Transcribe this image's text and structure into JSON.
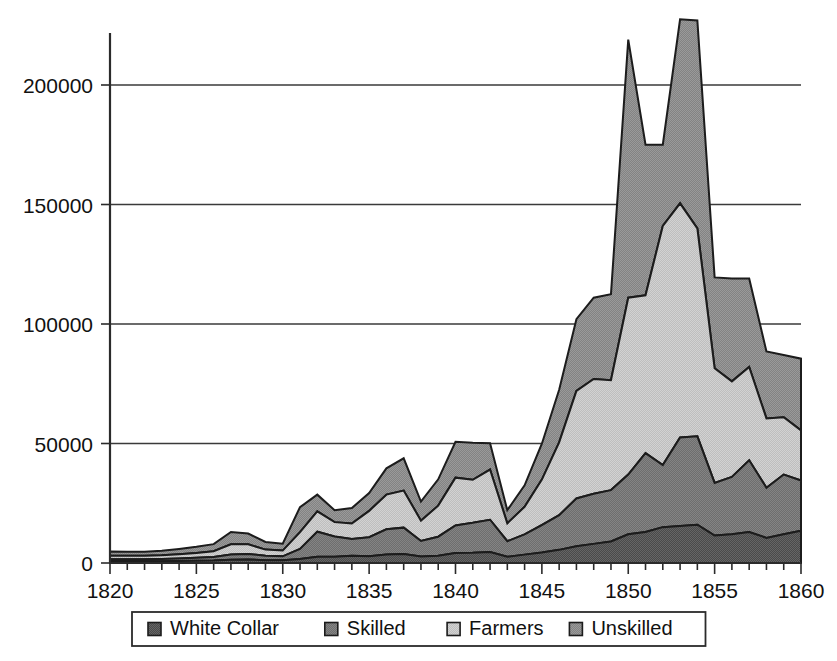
{
  "chart_data": {
    "type": "area",
    "stacked": true,
    "title": "",
    "subtitle": "",
    "xlabel": "",
    "ylabel": "",
    "xlim": [
      1820,
      1860
    ],
    "ylim": [
      0,
      225000
    ],
    "grid": true,
    "legend_position": "bottom",
    "y_ticks": [
      0,
      50000,
      100000,
      150000,
      200000
    ],
    "y_tick_labels": [
      "0",
      "50000",
      "100000",
      "150000",
      "200000"
    ],
    "x_ticks": [
      1820,
      1825,
      1830,
      1835,
      1840,
      1845,
      1850,
      1855,
      1860
    ],
    "x_tick_labels": [
      "1820",
      "1825",
      "1830",
      "1835",
      "1840",
      "1845",
      "1850",
      "1855",
      "1860"
    ],
    "x_minor_tick_interval": 1,
    "x": [
      1820,
      1821,
      1822,
      1823,
      1824,
      1825,
      1826,
      1827,
      1828,
      1829,
      1830,
      1831,
      1832,
      1833,
      1834,
      1835,
      1836,
      1837,
      1838,
      1839,
      1840,
      1841,
      1842,
      1843,
      1844,
      1845,
      1846,
      1847,
      1848,
      1849,
      1850,
      1851,
      1852,
      1853,
      1854,
      1855,
      1856,
      1857,
      1858,
      1859,
      1860
    ],
    "series": [
      {
        "name": "White Collar",
        "color": "#555555",
        "order": 1,
        "values": [
          700,
          700,
          700,
          700,
          800,
          900,
          1000,
          1400,
          1500,
          1200,
          1100,
          1700,
          2600,
          2600,
          3000,
          2800,
          3600,
          3800,
          2700,
          3000,
          4200,
          4300,
          4600,
          2600,
          3500,
          4400,
          5500,
          7000,
          8000,
          9000,
          12000,
          13000,
          15000,
          15500,
          16000,
          11500,
          12000,
          13000,
          10500,
          12000,
          13500
        ]
      },
      {
        "name": "Skilled",
        "color": "#777777",
        "order": 2,
        "values": [
          900,
          900,
          900,
          1000,
          1100,
          1300,
          1500,
          2200,
          2300,
          1800,
          1700,
          4200,
          10500,
          8500,
          7000,
          8000,
          10500,
          11000,
          6500,
          8000,
          11500,
          12500,
          13500,
          6500,
          8500,
          11500,
          14500,
          20000,
          21000,
          21500,
          25000,
          33000,
          26000,
          37000,
          37000,
          22000,
          24000,
          30000,
          21000,
          25000,
          21000
        ]
      },
      {
        "name": "Farmers",
        "color": "#c4c4c4",
        "order": 3,
        "values": [
          1400,
          1400,
          1400,
          1500,
          1800,
          2000,
          2400,
          4200,
          4000,
          2600,
          2400,
          7000,
          8500,
          6000,
          6500,
          11000,
          14500,
          15500,
          8500,
          13000,
          20000,
          18000,
          21000,
          7500,
          11500,
          19000,
          30500,
          45000,
          48000,
          46000,
          74000,
          66000,
          100000,
          98000,
          87000,
          48000,
          40000,
          39000,
          29000,
          24000,
          21000
        ]
      },
      {
        "name": "Unskilled",
        "color": "#8c8c8c",
        "order": 4,
        "values": [
          1800,
          1700,
          1700,
          1900,
          2200,
          2600,
          3000,
          5200,
          4500,
          3200,
          2900,
          10500,
          7000,
          5000,
          6500,
          7500,
          11000,
          13500,
          8000,
          11000,
          15000,
          15500,
          11000,
          5500,
          9000,
          15000,
          22000,
          30000,
          34000,
          36000,
          108000,
          63000,
          34000,
          77000,
          87000,
          38000,
          43000,
          37000,
          28000,
          26000,
          30000
        ]
      }
    ],
    "totals": [
      4800,
      4700,
      4700,
      5100,
      5900,
      6800,
      7900,
      13000,
      12300,
      8800,
      8100,
      23400,
      28600,
      22100,
      23000,
      29300,
      39600,
      43800,
      25700,
      35000,
      50700,
      50300,
      50100,
      22100,
      32500,
      49900,
      72500,
      102000,
      111000,
      112500,
      219000,
      175000,
      175000,
      227500,
      227000,
      119500,
      119000,
      119000,
      88500,
      87000,
      85500
    ],
    "notable_points": [
      {
        "year": 1850,
        "total": 219000,
        "label": "first major peak"
      },
      {
        "year": 1853,
        "total": 227500,
        "label": "highest peak"
      },
      {
        "year": 1843,
        "total": 22100,
        "label": "trough"
      },
      {
        "year": 1860,
        "total": 85500,
        "label": "end of series"
      }
    ]
  },
  "legend": {
    "items": [
      {
        "label": "White Collar",
        "color": "#555555"
      },
      {
        "label": "Skilled",
        "color": "#777777"
      },
      {
        "label": "Farmers",
        "color": "#c4c4c4"
      },
      {
        "label": "Unskilled",
        "color": "#8c8c8c"
      }
    ]
  },
  "colors": {
    "axis": "#2b2b2b",
    "grid": "#3a3a3a",
    "outline": "#1c1c1c",
    "background": "#ffffff"
  }
}
